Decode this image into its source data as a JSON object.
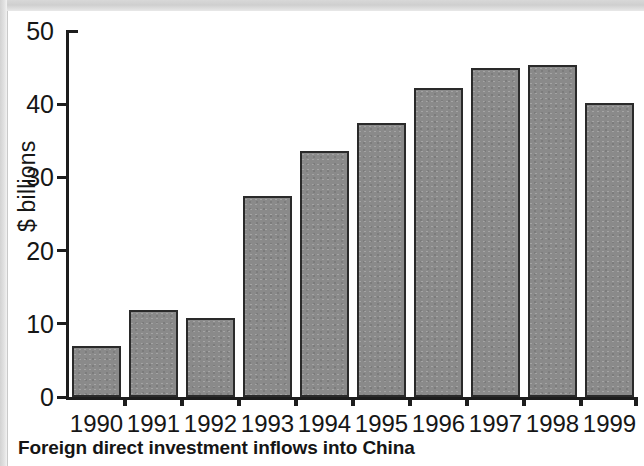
{
  "caption": "Foreign direct investment inflows into China",
  "chart_data": {
    "type": "bar",
    "title": "Foreign direct investment inflows into China",
    "xlabel": "",
    "ylabel": "$ billions",
    "categories": [
      "1990",
      "1991",
      "1992",
      "1993",
      "1994",
      "1995",
      "1996",
      "1997",
      "1998",
      "1999"
    ],
    "values": [
      7.0,
      11.9,
      10.8,
      27.4,
      33.6,
      37.5,
      42.2,
      45.0,
      45.3,
      40.2
    ],
    "ylim": [
      0,
      50
    ],
    "yticks": [
      0,
      10,
      20,
      30,
      40,
      50
    ],
    "ytick_labels": [
      "0",
      "10",
      "20",
      "30",
      "40",
      "50"
    ],
    "grid": false,
    "legend": false,
    "bar_color": "#8a8a8a",
    "bar_edge_color": "#2a2a2a",
    "axis_color": "#1d1d1d"
  }
}
